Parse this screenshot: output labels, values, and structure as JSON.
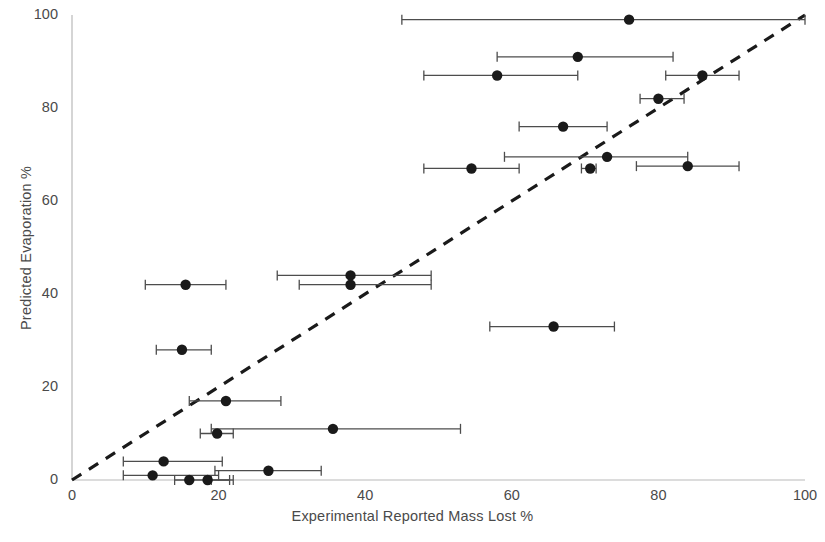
{
  "chart_data": {
    "type": "scatter",
    "title": "",
    "xlabel": "Experimental Reported Mass Lost %",
    "ylabel": "Predicted Evaporation %",
    "xlim": [
      0,
      100
    ],
    "ylim": [
      0,
      100
    ],
    "xticks": [
      0,
      20,
      40,
      60,
      80,
      100
    ],
    "yticks": [
      0,
      20,
      40,
      60,
      80,
      100
    ],
    "xtick_labels": [
      "0",
      "20",
      "40",
      "60",
      "80",
      "100"
    ],
    "ytick_labels": [
      "0",
      "20",
      "40",
      "60",
      "80",
      "100"
    ],
    "grid": false,
    "legend": null,
    "marker": {
      "shape": "circle",
      "color": "#1a1a1a",
      "size": 9
    },
    "error_bars": {
      "orientation": "horizontal",
      "color": "#4d4d4d",
      "capped": true
    },
    "reference_line": {
      "label": "y = x parity line",
      "style": "dashed",
      "color": "#1a1a1a",
      "x": [
        0,
        100
      ],
      "y": [
        0,
        100
      ]
    },
    "points": [
      {
        "x": 76.0,
        "y": 99.0,
        "x_low": 45.0,
        "x_high": 100.0
      },
      {
        "x": 69.0,
        "y": 91.0,
        "x_low": 58.0,
        "x_high": 82.0
      },
      {
        "x": 58.0,
        "y": 87.0,
        "x_low": 48.0,
        "x_high": 69.0
      },
      {
        "x": 86.0,
        "y": 87.0,
        "x_low": 81.0,
        "x_high": 91.0
      },
      {
        "x": 80.0,
        "y": 82.0,
        "x_low": 77.5,
        "x_high": 83.5
      },
      {
        "x": 67.0,
        "y": 76.0,
        "x_low": 61.0,
        "x_high": 73.0
      },
      {
        "x": 73.0,
        "y": 69.5,
        "x_low": 59.0,
        "x_high": 84.0
      },
      {
        "x": 70.7,
        "y": 67.0,
        "x_low": 69.5,
        "x_high": 71.5
      },
      {
        "x": 84.0,
        "y": 67.5,
        "x_low": 77.0,
        "x_high": 91.0
      },
      {
        "x": 54.5,
        "y": 67.0,
        "x_low": 48.0,
        "x_high": 61.0
      },
      {
        "x": 38.0,
        "y": 44.0,
        "x_low": 28.0,
        "x_high": 49.0
      },
      {
        "x": 38.0,
        "y": 42.0,
        "x_low": 31.0,
        "x_high": 49.0
      },
      {
        "x": 15.5,
        "y": 42.0,
        "x_low": 10.0,
        "x_high": 21.0
      },
      {
        "x": 65.7,
        "y": 33.0,
        "x_low": 57.0,
        "x_high": 74.0
      },
      {
        "x": 15.0,
        "y": 28.0,
        "x_low": 11.5,
        "x_high": 19.0
      },
      {
        "x": 21.0,
        "y": 17.0,
        "x_low": 16.0,
        "x_high": 28.5
      },
      {
        "x": 35.6,
        "y": 11.0,
        "x_low": 19.0,
        "x_high": 53.0
      },
      {
        "x": 19.8,
        "y": 10.0,
        "x_low": 17.5,
        "x_high": 22.0
      },
      {
        "x": 26.8,
        "y": 2.0,
        "x_low": 19.5,
        "x_high": 34.0
      },
      {
        "x": 12.5,
        "y": 4.0,
        "x_low": 7.0,
        "x_high": 20.5
      },
      {
        "x": 11.0,
        "y": 1.0,
        "x_low": 7.0,
        "x_high": 20.0
      },
      {
        "x": 16.0,
        "y": 0.0,
        "x_low": 14.0,
        "x_high": 21.5
      },
      {
        "x": 18.5,
        "y": 0.0,
        "x_low": 19.0,
        "x_high": 22.0
      }
    ]
  },
  "colors": {
    "marker": "#1a1a1a",
    "errorbar": "#4d4d4d",
    "axis": "#b9b9b9",
    "text": "#4a4a4a",
    "background": "#ffffff"
  }
}
